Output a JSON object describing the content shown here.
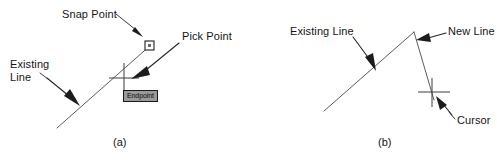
{
  "figure": {
    "panels": [
      {
        "id": "a",
        "caption": "(a)",
        "labels": {
          "snap_point": "Snap Point",
          "pick_point": "Pick Point",
          "existing_line": "Existing\nLine"
        },
        "tooltip": "Endpoint",
        "markers": {
          "snap_marker": "square-snap-marker",
          "cursor": "crosshair-cursor"
        }
      },
      {
        "id": "b",
        "caption": "(b)",
        "labels": {
          "existing_line": "Existing Line",
          "new_line": "New Line",
          "cursor": "Cursor"
        },
        "markers": {
          "cursor": "crosshair-cursor"
        }
      }
    ]
  },
  "colors": {
    "background": "#ffffff",
    "geometry_line": "#4a4a4a",
    "leader": "#262626",
    "text": "#141414",
    "tooltip_background": "#9a9a9a",
    "tooltip_border": "#1a1a1a",
    "snap_marker_stroke": "#1f1f1f",
    "snap_marker_inner": "#6e6e6e"
  }
}
